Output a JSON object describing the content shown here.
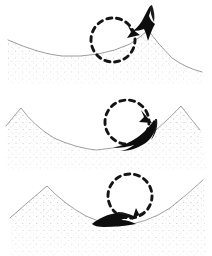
{
  "figure": {
    "domain_type": "diagram",
    "background_color": "#ffffff",
    "ink_color": "#1a1a1a",
    "stipple_color": "#3a3a3a",
    "width": 212,
    "height": 256,
    "panel_count": 3
  },
  "panels": [
    {
      "id": "panel-1",
      "label": "top-panel",
      "stage": "1",
      "description": "Object perched on right-hand peak crest",
      "y": 0,
      "height": 84,
      "terrain": {
        "type": "concave-valley",
        "profile_name": "left-low-right-peak",
        "peak_x": 148,
        "peak_y": 30,
        "valley_x": 62,
        "valley_y": 56,
        "left_edge_y": 40,
        "right_edge_y": 72
      },
      "rotation_marker": {
        "name": "dashed-rotation-circle",
        "center_x": 113,
        "center_y": 40,
        "radius": 22,
        "dash_count": 14,
        "direction": "clockwise",
        "arrowhead_angle_deg": 325
      },
      "object": {
        "name": "dark-wedge-object",
        "center_x": 145,
        "center_y": 27,
        "orientation": "upright-on-crest",
        "state": "perched"
      }
    },
    {
      "id": "panel-2",
      "label": "middle-panel",
      "stage": "2",
      "description": "Object sliding down right slope toward valley",
      "y": 86,
      "height": 84,
      "terrain": {
        "type": "concave-valley",
        "profile_name": "twin-peaks-valley",
        "peak_left_x": 21,
        "peak_left_y": 22,
        "peak_right_x": 181,
        "peak_right_y": 20,
        "valley_x": 96,
        "valley_y": 64,
        "left_edge_y": 40,
        "right_edge_y": 44
      },
      "rotation_marker": {
        "name": "dashed-rotation-circle",
        "center_x": 127,
        "center_y": 36,
        "radius": 22,
        "dash_count": 14,
        "direction": "clockwise",
        "arrowhead_angle_deg": 40
      },
      "object": {
        "name": "dark-wedge-object",
        "center_x": 136,
        "center_y": 55,
        "orientation": "tilted-on-slope",
        "state": "sliding"
      }
    },
    {
      "id": "panel-3",
      "label": "bottom-panel",
      "stage": "3",
      "description": "Object settled flat at the valley floor",
      "y": 172,
      "height": 84,
      "terrain": {
        "type": "concave-valley",
        "profile_name": "twin-peaks-wide-valley",
        "peak_left_x": 47,
        "peak_left_y": 14,
        "peak_right_x": 203,
        "peak_right_y": 8,
        "valley_x": 118,
        "valley_y": 54,
        "left_edge_y": 44,
        "right_edge_y": 40
      },
      "rotation_marker": {
        "name": "dashed-rotation-circle",
        "center_x": 130,
        "center_y": 24,
        "radius": 22,
        "dash_count": 14,
        "direction": "clockwise",
        "arrowhead_angle_deg": 95
      },
      "object": {
        "name": "dark-wedge-object",
        "center_x": 118,
        "center_y": 50,
        "orientation": "horizontal-at-rest",
        "state": "settled"
      }
    }
  ]
}
